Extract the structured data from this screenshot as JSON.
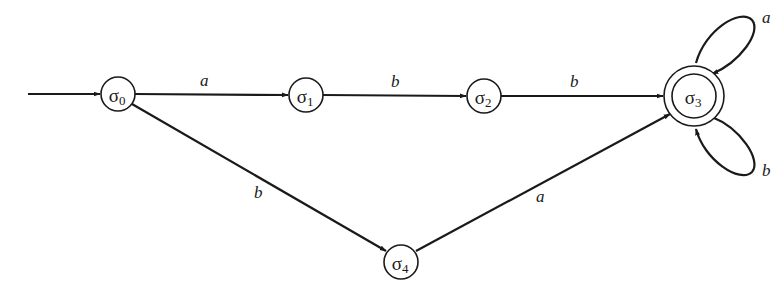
{
  "diagram": {
    "type": "finite-state-automaton",
    "start_state": "σ0",
    "accepting_states": [
      "σ3"
    ],
    "states": [
      {
        "id": "s0",
        "symbol": "σ",
        "index": "0",
        "x": 118,
        "y": 94
      },
      {
        "id": "s1",
        "symbol": "σ",
        "index": "1",
        "x": 306,
        "y": 95
      },
      {
        "id": "s2",
        "symbol": "σ",
        "index": "2",
        "x": 484,
        "y": 96
      },
      {
        "id": "s3",
        "symbol": "σ",
        "index": "3",
        "x": 694,
        "y": 96,
        "accepting": true
      },
      {
        "id": "s4",
        "symbol": "σ",
        "index": "4",
        "x": 401,
        "y": 262
      }
    ],
    "transitions": [
      {
        "from": "σ0",
        "to": "σ1",
        "label": "a"
      },
      {
        "from": "σ1",
        "to": "σ2",
        "label": "b"
      },
      {
        "from": "σ2",
        "to": "σ3",
        "label": "b"
      },
      {
        "from": "σ0",
        "to": "σ4",
        "label": "b"
      },
      {
        "from": "σ4",
        "to": "σ3",
        "label": "a"
      },
      {
        "from": "σ3",
        "to": "σ3",
        "label": "a"
      },
      {
        "from": "σ3",
        "to": "σ3",
        "label": "b"
      }
    ],
    "labels": {
      "s0_s1": "a",
      "s1_s2": "b",
      "s2_s3": "b",
      "s0_s4": "b",
      "s4_s3": "a",
      "s3_loop_top": "a",
      "s3_loop_bottom": "b"
    },
    "colors": {
      "stroke": "#1a1a1a",
      "background": "#ffffff"
    }
  }
}
